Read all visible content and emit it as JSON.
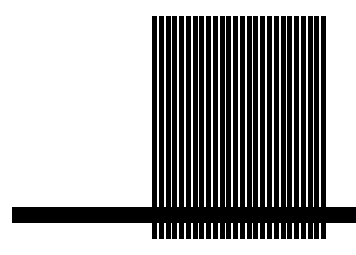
{
  "figure": {
    "background": "#ffffff",
    "foreground": "#000000",
    "stripe_block": {
      "left": 152,
      "top": 16,
      "width": 176,
      "height": 223,
      "stripe_count": 26,
      "stripe_width": 5,
      "gap_width": 1.8
    },
    "horizontal_bar": {
      "left": 12,
      "top": 207,
      "width": 344,
      "height": 16
    }
  }
}
